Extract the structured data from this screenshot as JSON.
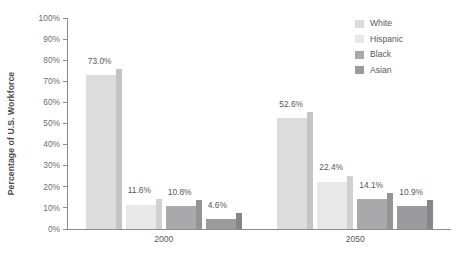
{
  "chart_data": {
    "type": "bar",
    "title": "",
    "xlabel": "",
    "ylabel": "Percentage of U.S. Workforce",
    "categories": [
      "2000",
      "2050"
    ],
    "ylim": [
      0,
      100
    ],
    "ytick_labels": [
      "100%",
      "90%",
      "80%",
      "70%",
      "60%",
      "50%",
      "40%",
      "30%",
      "20%",
      "10%",
      "0%"
    ],
    "ytick_values": [
      100,
      90,
      80,
      70,
      60,
      50,
      40,
      30,
      20,
      10,
      0
    ],
    "grid": false,
    "legend_position": "top-right",
    "series": [
      {
        "name": "White",
        "color": "#dcdcdc",
        "shadow_color": "#c4c4c4",
        "values": [
          73.0,
          52.6
        ],
        "labels": [
          "73.0%",
          "52.6%"
        ]
      },
      {
        "name": "Hispanic",
        "color": "#e8e8e8",
        "shadow_color": "#d0d0d0",
        "values": [
          11.6,
          22.4
        ],
        "labels": [
          "11.6%",
          "22.4%"
        ]
      },
      {
        "name": "Black",
        "color": "#a9a9ab",
        "shadow_color": "#949496",
        "values": [
          10.8,
          14.1
        ],
        "labels": [
          "10.8%",
          "14.1%"
        ]
      },
      {
        "name": "Asian",
        "color": "#9b9b9d",
        "shadow_color": "#868688",
        "values": [
          4.6,
          10.9
        ],
        "labels": [
          "4.6%",
          "10.9%"
        ]
      }
    ]
  },
  "legend": {
    "items": [
      {
        "label": "White"
      },
      {
        "label": "Hispanic"
      },
      {
        "label": "Black"
      },
      {
        "label": "Asian"
      }
    ]
  },
  "axis": {
    "y_title": "Percentage of U.S. Workforce",
    "axis_color": "#8c8c8e",
    "tick_text_color": "#6d6e70"
  }
}
